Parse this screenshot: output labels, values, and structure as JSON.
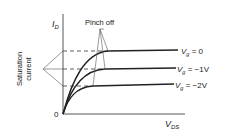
{
  "diagram": {
    "y_axis_label": "I",
    "y_axis_sub": "D",
    "x_axis_label": "V",
    "x_axis_sub": "DS",
    "origin_label": "0",
    "pinch_off_label": "Pinch off",
    "saturation_label_line1": "Saturation",
    "saturation_label_line2": "current",
    "curves": [
      {
        "name": "V",
        "sub": "g",
        "value": " = 0",
        "plateau_y": 51,
        "knee_x": 108
      },
      {
        "name": "V",
        "sub": "g",
        "value": " = −1V",
        "plateau_y": 69,
        "knee_x": 105
      },
      {
        "name": "V",
        "sub": "g",
        "value": " = −2V",
        "plateau_y": 86,
        "knee_x": 93
      }
    ],
    "colors": {
      "line": "#222222",
      "thin": "#555555"
    }
  }
}
